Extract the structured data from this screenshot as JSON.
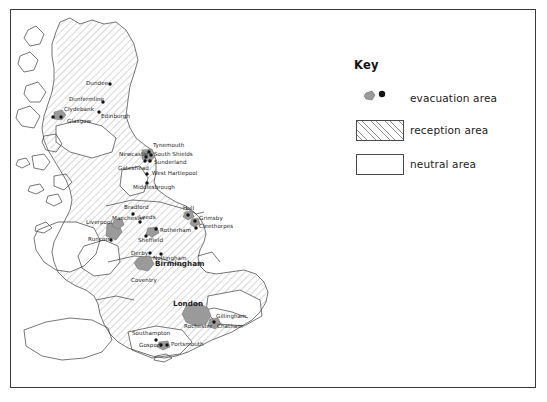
{
  "figure": {
    "type": "map",
    "region": "Great Britain",
    "frame_border_color": "#3a3a3a",
    "background_color": "#ffffff"
  },
  "key": {
    "title": "Key",
    "items": [
      {
        "symbol": "evacuation-symbol",
        "label": "evacuation area",
        "fill": "#9a9a9a",
        "dot_color": "#121212"
      },
      {
        "symbol": "hatched-box",
        "label": "reception area",
        "fill": "#ffffff",
        "hatch_color": "#8e8e8e"
      },
      {
        "symbol": "plain-box",
        "label": "neutral area",
        "fill": "#ffffff",
        "border": "#4a4a4a"
      }
    ]
  },
  "map": {
    "evacuation_color": "#9a9a9a",
    "reception_hatch_color": "#8e8e8e",
    "neutral_color": "#ffffff",
    "coast_color": "#3c3c3c",
    "cities": [
      {
        "name": "Dundee",
        "label_x": 86,
        "label_y": 84,
        "dot_x": 110,
        "dot_y": 84,
        "emphasis": "normal"
      },
      {
        "name": "Dunfermline",
        "label_x": 69,
        "label_y": 100,
        "dot_x": 103,
        "dot_y": 102,
        "emphasis": "normal"
      },
      {
        "name": "Clydebank",
        "label_x": 64,
        "label_y": 110,
        "dot_x": 61,
        "dot_y": 117,
        "emphasis": "normal"
      },
      {
        "name": "Edinburgh",
        "label_x": 101,
        "label_y": 117,
        "dot_x": 99,
        "dot_y": 112,
        "emphasis": "normal"
      },
      {
        "name": "Glasgow",
        "label_x": 67,
        "label_y": 122,
        "dot_x": 53,
        "dot_y": 117,
        "emphasis": "normal"
      },
      {
        "name": "Tynemouth",
        "label_x": 153,
        "label_y": 146,
        "dot_x": 149,
        "dot_y": 152,
        "emphasis": "normal"
      },
      {
        "name": "Newcastle",
        "label_x": 120,
        "label_y": 155,
        "dot_x": 146,
        "dot_y": 157,
        "emphasis": "normal"
      },
      {
        "name": "South Shields",
        "label_x": 153,
        "label_y": 155,
        "dot_x": 150,
        "dot_y": 156,
        "emphasis": "normal"
      },
      {
        "name": "Sunderland",
        "label_x": 153,
        "label_y": 163,
        "dot_x": 150,
        "dot_y": 163,
        "emphasis": "normal"
      },
      {
        "name": "Gateshead",
        "label_x": 119,
        "label_y": 169,
        "dot_x": 146,
        "dot_y": 161,
        "emphasis": "normal"
      },
      {
        "name": "West Hartlepool",
        "label_x": 152,
        "label_y": 174,
        "dot_x": 147,
        "dot_y": 174,
        "emphasis": "normal"
      },
      {
        "name": "Middlesbrough",
        "label_x": 133,
        "label_y": 188,
        "dot_x": 147,
        "dot_y": 183,
        "emphasis": "normal"
      },
      {
        "name": "Bradford",
        "label_x": 125,
        "label_y": 208,
        "dot_x": 133,
        "dot_y": 214,
        "emphasis": "normal"
      },
      {
        "name": "Hull",
        "label_x": 183,
        "label_y": 209,
        "dot_x": 188,
        "dot_y": 215,
        "emphasis": "normal"
      },
      {
        "name": "Manchester",
        "label_x": 116,
        "label_y": 219,
        "dot_x": 117,
        "dot_y": 225,
        "emphasis": "normal"
      },
      {
        "name": "Leeds",
        "label_x": 140,
        "label_y": 217,
        "dot_x": 140,
        "dot_y": 222,
        "emphasis": "normal"
      },
      {
        "name": "Grimsby",
        "label_x": 199,
        "label_y": 219,
        "dot_x": 195,
        "dot_y": 221,
        "emphasis": "normal"
      },
      {
        "name": "Liverpool",
        "label_x": 88,
        "label_y": 223,
        "dot_x": 111,
        "dot_y": 229,
        "emphasis": "normal"
      },
      {
        "name": "Cleethorpes",
        "label_x": 199,
        "label_y": 227,
        "dot_x": 196,
        "dot_y": 228,
        "emphasis": "normal"
      },
      {
        "name": "Rotherham",
        "label_x": 160,
        "label_y": 231,
        "dot_x": 156,
        "dot_y": 229,
        "emphasis": "normal"
      },
      {
        "name": "Runcorn",
        "label_x": 89,
        "label_y": 240,
        "dot_x": 111,
        "dot_y": 240,
        "emphasis": "normal"
      },
      {
        "name": "Sheffield",
        "label_x": 139,
        "label_y": 241,
        "dot_x": 146,
        "dot_y": 236,
        "emphasis": "normal"
      },
      {
        "name": "Derby",
        "label_x": 132,
        "label_y": 254,
        "dot_x": 150,
        "dot_y": 253,
        "emphasis": "normal"
      },
      {
        "name": "Nottingham",
        "label_x": 153,
        "label_y": 259,
        "dot_x": 161,
        "dot_y": 254,
        "emphasis": "normal"
      },
      {
        "name": "Birmingham",
        "label_x": 155,
        "label_y": 265,
        "dot_x": null,
        "dot_y": null,
        "emphasis": "bold"
      },
      {
        "name": "Coventry",
        "label_x": 131,
        "label_y": 281,
        "dot_x": null,
        "dot_y": null,
        "emphasis": "normal"
      },
      {
        "name": "London",
        "label_x": 174,
        "label_y": 304,
        "dot_x": null,
        "dot_y": null,
        "emphasis": "bold"
      },
      {
        "name": "Gillingham",
        "label_x": 216,
        "label_y": 317,
        "dot_x": 214,
        "dot_y": 322,
        "emphasis": "normal"
      },
      {
        "name": "Rochester",
        "label_x": 185,
        "label_y": 327,
        "dot_x": 213,
        "dot_y": 323,
        "emphasis": "normal"
      },
      {
        "name": "Chatham",
        "label_x": 216,
        "label_y": 327,
        "dot_x": 214,
        "dot_y": 324,
        "emphasis": "normal"
      },
      {
        "name": "Southampton",
        "label_x": 133,
        "label_y": 334,
        "dot_x": 156,
        "dot_y": 340,
        "emphasis": "normal"
      },
      {
        "name": "Portsmouth",
        "label_x": 172,
        "label_y": 344,
        "dot_x": 167,
        "dot_y": 345,
        "emphasis": "normal"
      },
      {
        "name": "Gosport",
        "label_x": 140,
        "label_y": 345,
        "dot_x": 161,
        "dot_y": 345,
        "emphasis": "normal"
      }
    ]
  }
}
